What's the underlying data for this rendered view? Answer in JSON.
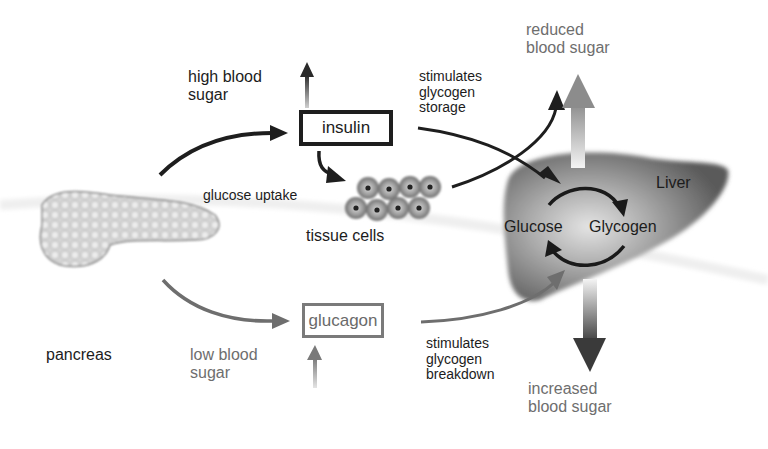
{
  "diagram": {
    "organs": {
      "pancreas": "pancreas",
      "liver": "Liver",
      "tissue_cells": "tissue cells"
    },
    "hormones": {
      "insulin": "insulin",
      "glucagon": "glucagon"
    },
    "triggers": {
      "high_blood_sugar": [
        "high blood",
        "sugar"
      ],
      "low_blood_sugar": [
        "low blood",
        "sugar"
      ]
    },
    "actions": {
      "glucose_uptake": "glucose uptake",
      "stimulates_storage": [
        "stimulates",
        "glycogen",
        "storage"
      ],
      "stimulates_breakdown": [
        "stimulates",
        "glycogen",
        "breakdown"
      ]
    },
    "liver_cycle": {
      "glucose": "Glucose",
      "glycogen": "Glycogen"
    },
    "outcomes": {
      "reduced_blood_sugar": [
        "reduced",
        "blood sugar"
      ],
      "increased_blood_sugar": [
        "increased",
        "blood sugar"
      ]
    },
    "colors": {
      "dark": "#1c1c1c",
      "gray": "#6e6e6e",
      "liver_fill": "#8a8a8a",
      "background": "#ffffff"
    }
  }
}
